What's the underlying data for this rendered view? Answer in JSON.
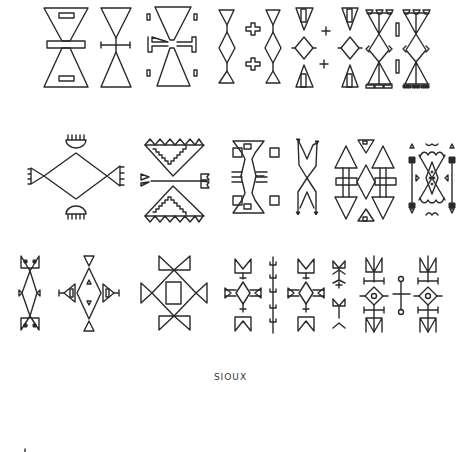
{
  "plate": {
    "caption": "SIOUX",
    "background": "#ffffff",
    "ink_color": "#2a2a2a",
    "rows": [
      {
        "name": "row-1",
        "motifs": [
          "hourglass-with-bars",
          "hourglass-with-crossbar",
          "hourglass-with-hooked-bar",
          "diamond-chain-with-crosses",
          "triangle-diamond-with-plus",
          "branched-hourglass-with-bars"
        ]
      },
      {
        "name": "row-2",
        "motifs": [
          "diamond-with-comb-triangles",
          "stepped-triangles-with-arrow",
          "hourglass-with-squares",
          "crossed-forked-x",
          "arrow-pairs-with-diamond",
          "ornate-figure"
        ]
      },
      {
        "name": "row-3",
        "motifs": [
          "diamond-with-butterfly-triangles",
          "diamond-with-side-triangles",
          "square-diamond-with-bowties",
          "cross-figures-with-forked-ends",
          "circle-diamond-crosses"
        ]
      }
    ]
  }
}
